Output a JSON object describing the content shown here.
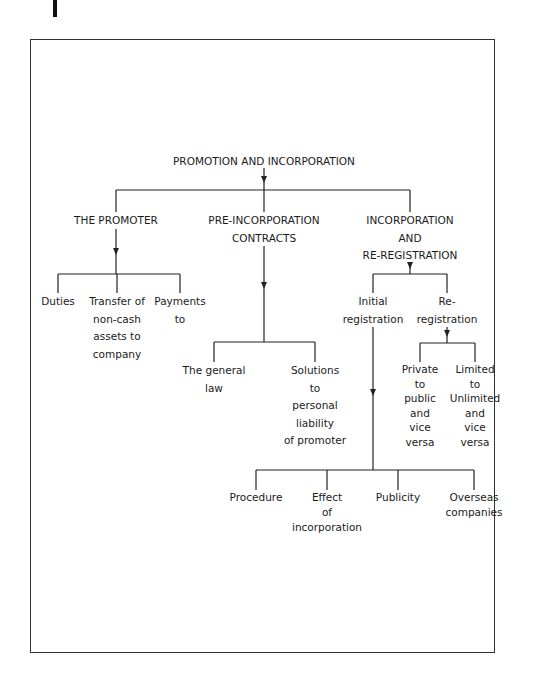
{
  "diagram": {
    "root": {
      "label": "PROMOTION AND INCORPORATION"
    },
    "branches": [
      {
        "id": "promoter",
        "lines": [
          "THE PROMOTER"
        ],
        "children": [
          {
            "lines": [
              "Duties"
            ]
          },
          {
            "lines": [
              "Transfer of",
              "non-cash",
              "assets to",
              "company"
            ]
          },
          {
            "lines": [
              "Payments",
              "to"
            ]
          }
        ]
      },
      {
        "id": "pre-incorporation",
        "lines": [
          "PRE-INCORPORATION",
          "CONTRACTS"
        ],
        "children": [
          {
            "lines": [
              "The general",
              "law"
            ]
          },
          {
            "lines": [
              "Solutions",
              "to",
              "personal",
              "liability",
              "of promoter"
            ]
          }
        ]
      },
      {
        "id": "incorporation",
        "lines": [
          "INCORPORATION",
          "AND",
          "RE-REGISTRATION"
        ],
        "children": [
          {
            "id": "initial-registration",
            "lines": [
              "Initial",
              "registration"
            ],
            "children": [
              {
                "lines": [
                  "Procedure"
                ]
              },
              {
                "lines": [
                  "Effect",
                  "of",
                  "incorporation"
                ]
              },
              {
                "lines": [
                  "Publicity"
                ]
              },
              {
                "lines": [
                  "Overseas",
                  "companies"
                ]
              }
            ]
          },
          {
            "id": "re-registration",
            "lines": [
              "Re-",
              "registration"
            ],
            "children": [
              {
                "lines": [
                  "Private",
                  "to",
                  "public",
                  "and",
                  "vice",
                  "versa"
                ]
              },
              {
                "lines": [
                  "Limited",
                  "to",
                  "Unlimited",
                  "and",
                  "vice",
                  "versa"
                ]
              }
            ]
          }
        ]
      }
    ]
  },
  "colors": {
    "line": "#222222",
    "text": "#1a1a1a",
    "frame": "#333333"
  }
}
